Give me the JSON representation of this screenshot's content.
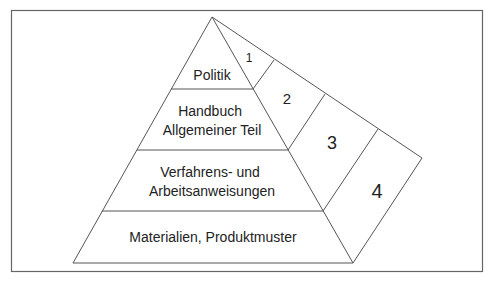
{
  "diagram": {
    "type": "pyramid",
    "layers": [
      {
        "id": "politik",
        "label_lines": [
          "Politik"
        ]
      },
      {
        "id": "handbuch",
        "label_lines": [
          "Handbuch",
          "Allgemeiner Teil"
        ]
      },
      {
        "id": "verfahren",
        "label_lines": [
          "Verfahrens- und",
          "Arbeitsanweisungen"
        ]
      },
      {
        "id": "materialien",
        "label_lines": [
          "Materialien, Produktmuster"
        ]
      }
    ],
    "side_segments": [
      {
        "id": "seg1",
        "label": "1"
      },
      {
        "id": "seg2",
        "label": "2"
      },
      {
        "id": "seg3",
        "label": "3"
      },
      {
        "id": "seg4",
        "label": "4"
      }
    ],
    "colors": {
      "line": "#555555",
      "frame": "#666666",
      "text": "#222222",
      "background": "#ffffff"
    }
  }
}
